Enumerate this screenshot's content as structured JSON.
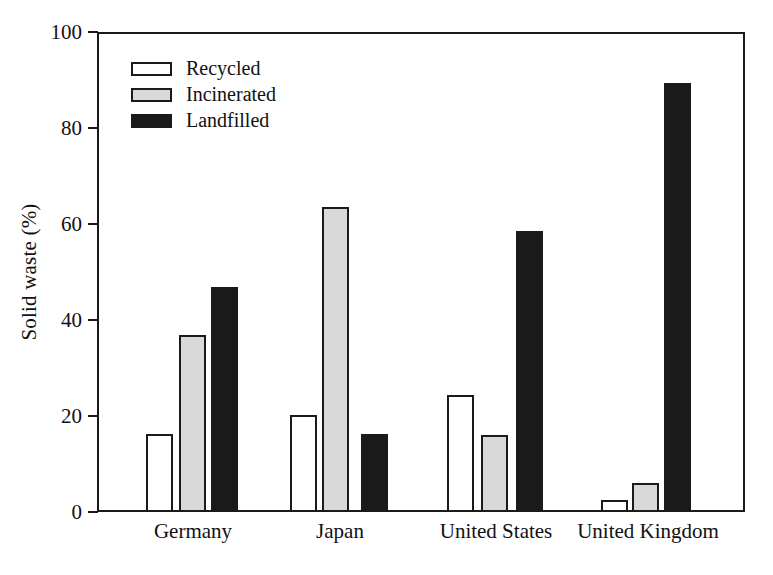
{
  "chart_data": {
    "type": "bar",
    "title": "",
    "xlabel": "",
    "ylabel": "Solid waste (%)",
    "ylim": [
      0,
      100
    ],
    "yticks": [
      0,
      20,
      40,
      60,
      80,
      100
    ],
    "ytick_labels": [
      "0",
      "20",
      "40",
      "60",
      "80",
      "100"
    ],
    "grid": false,
    "legend_position": "upper-left-inside",
    "categories": [
      "Germany",
      "Japan",
      "United States",
      "United Kingdom"
    ],
    "series": [
      {
        "name": "Recycled",
        "color": "#ffffff",
        "edge_color": "#1a1a1a",
        "values": [
          16.3,
          20.2,
          24.3,
          2.5
        ]
      },
      {
        "name": "Incinerated",
        "color": "#d9d9d9",
        "edge_color": "#1a1a1a",
        "values": [
          36.8,
          63.5,
          16.0,
          6.0
        ]
      },
      {
        "name": "Landfilled",
        "color": "#1a1a1a",
        "edge_color": "#1a1a1a",
        "values": [
          46.8,
          16.2,
          58.5,
          89.3
        ]
      }
    ]
  },
  "axes": {
    "y_title": "Solid waste (%)",
    "y_tick_labels": [
      "100",
      "80",
      "60",
      "40",
      "20",
      "0"
    ],
    "x_tick_labels": [
      "Germany",
      "Japan",
      "United States",
      "United Kingdom"
    ]
  },
  "legend": {
    "entries": [
      {
        "label": "Recycled",
        "swatch": "recycled"
      },
      {
        "label": "Incinerated",
        "swatch": "incinerated"
      },
      {
        "label": "Landfilled",
        "swatch": "landfilled"
      }
    ]
  },
  "colors": {
    "axis": "#1a1a1a",
    "recycled": "#ffffff",
    "incinerated": "#d9d9d9",
    "landfilled": "#1a1a1a",
    "background": "#ffffff"
  }
}
